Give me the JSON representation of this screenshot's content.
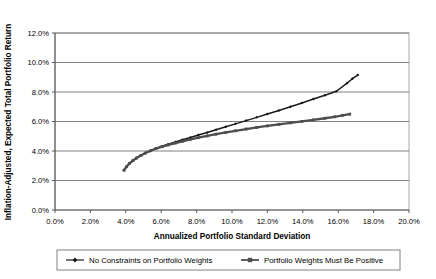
{
  "chart_data": {
    "type": "line",
    "title": "",
    "xlabel": "Annualized Portfolio Standard Deviation",
    "ylabel": "Inflation-Adjusted, Expected Total Portfolio Return",
    "xlim": [
      0,
      20
    ],
    "ylim": [
      0,
      12
    ],
    "x_ticks": [
      "0.0%",
      "2.0%",
      "4.0%",
      "6.0%",
      "8.0%",
      "10.0%",
      "12.0%",
      "14.0%",
      "16.0%",
      "18.0%",
      "20.0%"
    ],
    "y_ticks": [
      "0.0%",
      "2.0%",
      "4.0%",
      "6.0%",
      "8.0%",
      "10.0%",
      "12.0%"
    ],
    "x_tick_values": [
      0,
      2,
      4,
      6,
      8,
      10,
      12,
      14,
      16,
      18,
      20
    ],
    "y_tick_values": [
      0,
      2,
      4,
      6,
      8,
      10,
      12
    ],
    "grid": "horizontal",
    "legend_position": "bottom",
    "series": [
      {
        "name": "No Constraints on Portfolio Weights",
        "marker": "diamond",
        "color": "#1a1a1a",
        "points": [
          [
            3.9,
            2.7
          ],
          [
            4.05,
            2.95
          ],
          [
            4.2,
            3.15
          ],
          [
            4.4,
            3.35
          ],
          [
            4.6,
            3.52
          ],
          [
            4.85,
            3.7
          ],
          [
            5.1,
            3.86
          ],
          [
            5.4,
            4.02
          ],
          [
            5.7,
            4.17
          ],
          [
            6.05,
            4.32
          ],
          [
            6.4,
            4.46
          ],
          [
            6.8,
            4.61
          ],
          [
            7.2,
            4.76
          ],
          [
            7.65,
            4.92
          ],
          [
            8.1,
            5.08
          ],
          [
            8.6,
            5.26
          ],
          [
            9.1,
            5.44
          ],
          [
            9.65,
            5.64
          ],
          [
            10.2,
            5.84
          ],
          [
            10.8,
            6.06
          ],
          [
            11.4,
            6.28
          ],
          [
            12.0,
            6.51
          ],
          [
            12.65,
            6.75
          ],
          [
            13.3,
            7.0
          ],
          [
            13.95,
            7.26
          ],
          [
            14.6,
            7.52
          ],
          [
            15.25,
            7.78
          ],
          [
            15.9,
            8.05
          ],
          [
            16.5,
            8.6
          ],
          [
            16.8,
            8.9
          ],
          [
            17.1,
            9.15
          ]
        ]
      },
      {
        "name": "Portfolio Weights Must Be Positive",
        "marker": "square",
        "color": "#4d4d4d",
        "points": [
          [
            3.9,
            2.7
          ],
          [
            4.05,
            2.95
          ],
          [
            4.2,
            3.15
          ],
          [
            4.4,
            3.35
          ],
          [
            4.6,
            3.52
          ],
          [
            4.85,
            3.7
          ],
          [
            5.1,
            3.86
          ],
          [
            5.4,
            4.02
          ],
          [
            5.7,
            4.16
          ],
          [
            6.05,
            4.29
          ],
          [
            6.4,
            4.41
          ],
          [
            6.8,
            4.54
          ],
          [
            7.2,
            4.66
          ],
          [
            7.65,
            4.79
          ],
          [
            8.1,
            4.9
          ],
          [
            8.6,
            5.02
          ],
          [
            9.1,
            5.14
          ],
          [
            9.65,
            5.26
          ],
          [
            10.2,
            5.37
          ],
          [
            10.8,
            5.49
          ],
          [
            11.4,
            5.6
          ],
          [
            12.0,
            5.7
          ],
          [
            12.65,
            5.81
          ],
          [
            13.3,
            5.91
          ],
          [
            13.95,
            6.01
          ],
          [
            14.6,
            6.11
          ],
          [
            15.25,
            6.22
          ],
          [
            15.8,
            6.32
          ],
          [
            16.25,
            6.42
          ],
          [
            16.65,
            6.5
          ]
        ]
      }
    ]
  },
  "legend": {
    "items": [
      {
        "label": "No Constraints on Portfolio Weights",
        "marker": "diamond"
      },
      {
        "label": "Portfolio Weights Must Be Positive",
        "marker": "square"
      }
    ]
  },
  "colors": {
    "series_1": "#1a1a1a",
    "series_2": "#4d4d4d",
    "gridline": "#808080",
    "axis": "#808080",
    "plot_border": "#a8a8a8",
    "background": "#ffffff"
  }
}
